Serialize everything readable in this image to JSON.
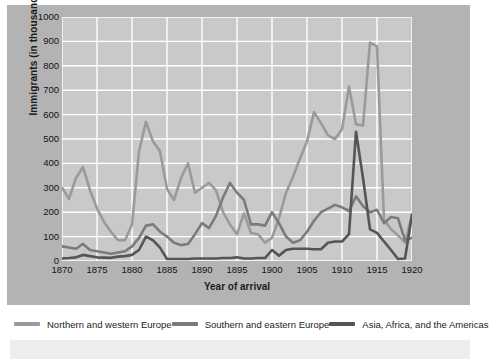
{
  "chart_data": {
    "type": "line",
    "title": "",
    "xlabel": "Year of arrival",
    "ylabel": "Immigrants (in thousands)",
    "xlim": [
      1870,
      1920
    ],
    "ylim": [
      0,
      1000
    ],
    "xticks": [
      1870,
      1875,
      1880,
      1885,
      1890,
      1895,
      1900,
      1905,
      1910,
      1915,
      1920
    ],
    "yticks": [
      0,
      100,
      200,
      300,
      400,
      500,
      600,
      700,
      800,
      900,
      1000
    ],
    "grid": true,
    "legend_position": "below",
    "x": [
      1870,
      1871,
      1872,
      1873,
      1874,
      1875,
      1876,
      1877,
      1878,
      1879,
      1880,
      1881,
      1882,
      1883,
      1884,
      1885,
      1886,
      1887,
      1888,
      1889,
      1890,
      1891,
      1892,
      1893,
      1894,
      1895,
      1896,
      1897,
      1898,
      1899,
      1900,
      1901,
      1902,
      1903,
      1904,
      1905,
      1906,
      1907,
      1908,
      1909,
      1910,
      1911,
      1912,
      1913,
      1914,
      1915,
      1916,
      1917,
      1918,
      1919,
      1920
    ],
    "series": [
      {
        "name": "Northern and western Europe",
        "color": "#9a9a9a",
        "values": [
          300,
          255,
          340,
          385,
          290,
          215,
          160,
          120,
          85,
          85,
          150,
          450,
          570,
          490,
          450,
          295,
          250,
          340,
          400,
          280,
          300,
          320,
          290,
          200,
          150,
          110,
          195,
          115,
          110,
          75,
          95,
          175,
          280,
          345,
          420,
          490,
          610,
          565,
          515,
          500,
          540,
          715,
          560,
          555,
          895,
          880,
          170,
          130,
          105,
          75,
          190
        ]
      },
      {
        "name": "Southern and eastern Europe",
        "color": "#7b7b7b",
        "values": [
          60,
          55,
          50,
          70,
          45,
          40,
          35,
          30,
          35,
          40,
          60,
          95,
          145,
          150,
          120,
          100,
          75,
          65,
          70,
          110,
          155,
          135,
          185,
          260,
          320,
          280,
          250,
          150,
          150,
          145,
          200,
          155,
          100,
          75,
          85,
          120,
          165,
          200,
          215,
          230,
          220,
          205,
          265,
          225,
          200,
          210,
          155,
          180,
          175,
          85,
          95
        ]
      },
      {
        "name": "Asia, Africa, and the Americas",
        "color": "#555555",
        "values": [
          10,
          12,
          15,
          25,
          20,
          15,
          14,
          13,
          18,
          20,
          25,
          45,
          100,
          85,
          55,
          8,
          8,
          8,
          8,
          10,
          10,
          10,
          10,
          12,
          12,
          15,
          10,
          10,
          12,
          12,
          45,
          22,
          45,
          50,
          50,
          50,
          48,
          48,
          75,
          80,
          80,
          110,
          530,
          340,
          130,
          115,
          80,
          45,
          8,
          10,
          190
        ]
      }
    ]
  },
  "axis": {
    "y_title": "Immigrants (in thousands)",
    "x_title": "Year of arrival",
    "y_labels": [
      "1000",
      "900",
      "800",
      "700",
      "600",
      "500",
      "400",
      "300",
      "200",
      "100",
      "0"
    ],
    "x_labels": [
      "1870",
      "1875",
      "1880",
      "1885",
      "1890",
      "1895",
      "1900",
      "1905",
      "1910",
      "1915",
      "1920"
    ]
  },
  "legend": {
    "items": [
      {
        "label": "Northern and western Europe",
        "color": "#9a9a9a"
      },
      {
        "label": "Southern and eastern Europe",
        "color": "#7b7b7b"
      },
      {
        "label": "Asia, Africa, and the Americas",
        "color": "#555555"
      }
    ]
  },
  "theme": {
    "figure_background": "#b3b3b3",
    "plot_background": "#c9c9c9",
    "grid_color": "#ffffff",
    "page_background": "#ffffff"
  }
}
